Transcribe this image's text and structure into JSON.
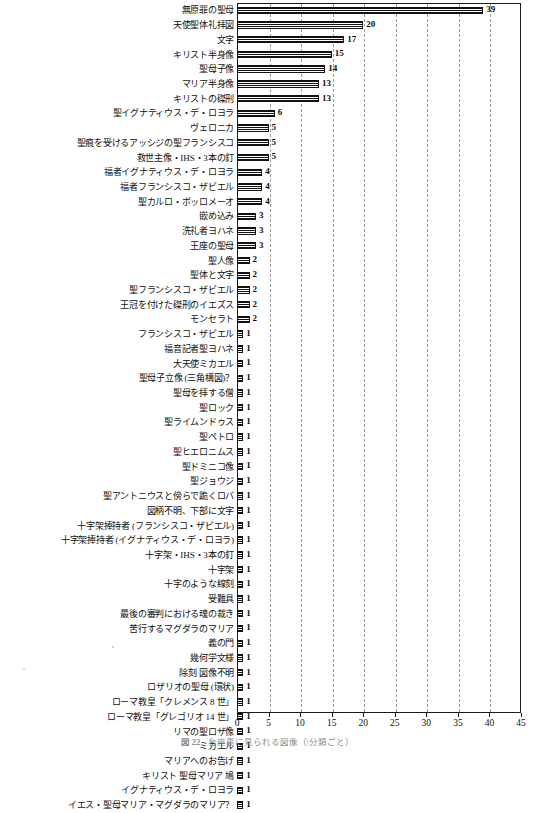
{
  "chart_data": {
    "type": "bar",
    "orientation": "horizontal",
    "title": "",
    "xlabel": "",
    "ylabel": "",
    "xlim": [
      0,
      45
    ],
    "xticks": [
      0,
      5,
      10,
      15,
      20,
      25,
      30,
      35,
      40,
      45
    ],
    "grid": "vertical-dashed",
    "legend": "none",
    "categories": [
      "無原罪の聖母",
      "天使聖体礼拝図",
      "文字",
      "キリスト半身像",
      "聖母子像",
      "マリア半身像",
      "キリストの磔刑",
      "聖イグナティウス・デ・ロヨラ",
      "ヴェロニカ",
      "聖痕を受けるアッシジの聖フランシスコ",
      "救世主像・IHS・3本の釘",
      "福者イグナティウス・デ・ロヨラ",
      "福者フランシスコ・ザビエル",
      "聖カルロ・ボッロメーオ",
      "嵌め込み",
      "洗礼者ヨハネ",
      "王座の聖母",
      "聖人像",
      "聖体と文字",
      "聖フランシスコ・ザビエル",
      "王冠を付けた磔刑のイエズス",
      "モンセラト",
      "フランシスコ・ザビエル",
      "福音記者聖ヨハネ",
      "大天使ミカエル",
      "聖母子立像 (三角構図)？",
      "聖母を拝する僧",
      "聖ロック",
      "聖ライムンドゥス",
      "聖ペトロ",
      "聖ヒエロニムス",
      "聖ドミニコ像",
      "聖ジョウジ",
      "聖アントニウスと傍らで跪くロバ",
      "図柄不明、下部に文字",
      "十字架捧持者 (フランシスコ・ザビエル)",
      "十字架捧持者 (イグナティウス・デ・ロヨラ)",
      "十字架・IHS・3本の釘",
      "十字架",
      "十字のような線刻",
      "受難具",
      "最後の審判における魂の裁き",
      "苦行するマグダラのマリア",
      "義の門",
      "幾何学文様",
      "除刻 図像不明",
      "ロザリオの聖母 (環状)",
      "ローマ教皇「クレメンス 8 世」",
      "ローマ教皇「グレゴリオ 14 世」",
      "リマの聖ロザ像",
      "ミカエル",
      "マリアへのお告げ",
      "キリスト 聖母マリア 鳩",
      "イグナティウス・デ・ロヨラ",
      "イエス・聖母マリア・マグダラのマリア？"
    ],
    "values": [
      39,
      20,
      17,
      15,
      14,
      13,
      13,
      6,
      5,
      5,
      5,
      4,
      4,
      4,
      3,
      3,
      3,
      2,
      2,
      2,
      2,
      2,
      1,
      1,
      1,
      1,
      1,
      1,
      1,
      1,
      1,
      1,
      1,
      1,
      1,
      1,
      1,
      1,
      1,
      1,
      1,
      1,
      1,
      1,
      1,
      1,
      1,
      1,
      1,
      1,
      1,
      1,
      1,
      1,
      1
    ]
  },
  "caption": {
    "figure_number": "図 22",
    "text": "台座裏に見られる図像（৷分類ごと）"
  },
  "colors": {
    "bar_fill": "#111111",
    "bar_edge": "#111111",
    "grid": "#9a9a9a",
    "axis": "#1a1a1a",
    "text": "#101010"
  }
}
